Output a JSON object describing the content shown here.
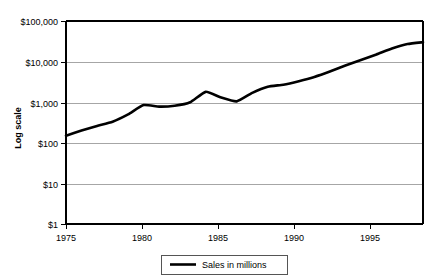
{
  "chart_data": {
    "type": "line",
    "title": "",
    "xlabel": "",
    "ylabel": "Log scale",
    "yscale": "log",
    "ylim": [
      1,
      100000
    ],
    "xlim": [
      1975,
      1998
    ],
    "grid": true,
    "legend_position": "bottom",
    "y_tick_labels": [
      "$1",
      "$10",
      "$100",
      "$1,000",
      "$10,000",
      "$100,000"
    ],
    "y_tick_values": [
      1,
      10,
      100,
      1000,
      10000,
      100000
    ],
    "x_tick_labels": [
      "1975",
      "1980",
      "1985",
      "1990",
      "1995"
    ],
    "x_tick_values": [
      1975,
      1980,
      1985,
      1990,
      1995
    ],
    "series": [
      {
        "name": "Sales in millions",
        "color": "#000000",
        "x": [
          1975,
          1976,
          1977,
          1978,
          1979,
          1980,
          1981,
          1982,
          1983,
          1984,
          1985,
          1986,
          1987,
          1988,
          1989,
          1990,
          1991,
          1992,
          1993,
          1994,
          1995,
          1996,
          1997,
          1998
        ],
        "values": [
          150,
          200,
          260,
          330,
          500,
          850,
          780,
          820,
          1000,
          1800,
          1300,
          1050,
          1700,
          2400,
          2700,
          3300,
          4200,
          5700,
          8000,
          11000,
          15000,
          21000,
          27000,
          30000
        ]
      }
    ]
  },
  "legend": {
    "entries": [
      {
        "label": "Sales in millions"
      }
    ]
  }
}
